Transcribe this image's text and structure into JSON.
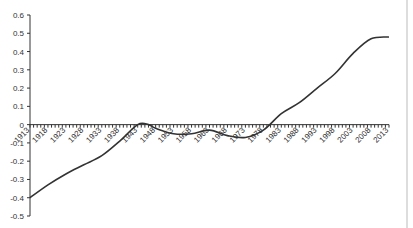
{
  "chart_data": {
    "type": "line",
    "title": "",
    "xlabel": "",
    "ylabel": "",
    "ylim": [
      -0.5,
      0.6
    ],
    "xlim": [
      1913,
      2013
    ],
    "y_ticks": [
      "0.6",
      "0.5",
      "0.4",
      "0.3",
      "0.2",
      "0.1",
      "0",
      "-0.1",
      "-0.2",
      "-0.3",
      "-0.4",
      "-0.5"
    ],
    "y_tick_values": [
      0.6,
      0.5,
      0.4,
      0.3,
      0.2,
      0.1,
      0,
      -0.1,
      -0.2,
      -0.3,
      -0.4,
      -0.5
    ],
    "x_tick_labels": [
      "1913",
      "1918",
      "1923",
      "1928",
      "1933",
      "1938",
      "1943",
      "1948",
      "1953",
      "1958",
      "1963",
      "1968",
      "1973",
      "1978",
      "1983",
      "1988",
      "1993",
      "1998",
      "2003",
      "2008",
      "2013"
    ],
    "grid": false,
    "legend": "none",
    "series": [
      {
        "name": "series-1",
        "color": "#333333",
        "x": [
          1913,
          1918,
          1923,
          1928,
          1933,
          1938,
          1943,
          1946,
          1948,
          1953,
          1958,
          1963,
          1968,
          1973,
          1978,
          1983,
          1988,
          1993,
          1998,
          2003,
          2008,
          2013
        ],
        "y": [
          -0.4,
          -0.33,
          -0.27,
          -0.22,
          -0.17,
          -0.09,
          0.0,
          0.0,
          -0.02,
          -0.05,
          -0.05,
          -0.03,
          -0.06,
          -0.07,
          -0.03,
          0.06,
          0.12,
          0.2,
          0.28,
          0.39,
          0.47,
          0.48
        ]
      }
    ]
  }
}
